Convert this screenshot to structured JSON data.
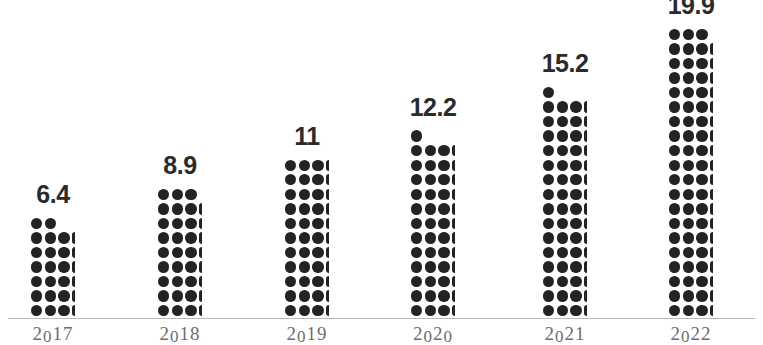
{
  "chart_data": {
    "type": "bar",
    "subtype": "dot-pictogram-column",
    "title": "",
    "subtitle": "",
    "xlabel": "",
    "ylabel": "",
    "categories": [
      "2017",
      "2018",
      "2019",
      "2020",
      "2021",
      "2022"
    ],
    "values": [
      6.4,
      8.9,
      11,
      12.2,
      15.2,
      19.9
    ],
    "value_labels": [
      "6.4",
      "8.9",
      "11",
      "12.2",
      "15.2",
      "19.9"
    ],
    "ylim": [
      0,
      19.9
    ],
    "grid": false,
    "legend": null,
    "annotations": [],
    "axis_line_visible": true,
    "series": [
      {
        "name": "",
        "values": [
          6.4,
          8.9,
          11,
          12.2,
          15.2,
          19.9
        ]
      }
    ]
  },
  "style": {
    "dot_color": "#232323",
    "value_label_color": "#2b2b2b",
    "year_label_color": "#6d6d6d",
    "axis_color": "#b9b9b9",
    "background": "#ffffff"
  },
  "bars": [
    {
      "year": "2017",
      "value_label": "6.4",
      "value": 6.4,
      "full_rows": 6,
      "frac": 0.4,
      "top_row_cols": 2,
      "bar_left": 31,
      "group_left": -9
    },
    {
      "year": "2018",
      "value_label": "8.9",
      "value": 8.9,
      "full_rows": 8,
      "frac": 0.9,
      "top_row_cols": 3,
      "bar_left": 158,
      "group_left": 118
    },
    {
      "year": "2019",
      "value_label": "11",
      "value": 11,
      "full_rows": 11,
      "frac": 0,
      "top_row_cols": 0,
      "bar_left": 285,
      "group_left": 245
    },
    {
      "year": "2020",
      "value_label": "12.2",
      "value": 12.2,
      "full_rows": 12,
      "frac": 0.2,
      "top_row_cols": 1,
      "bar_left": 411,
      "group_left": 371
    },
    {
      "year": "2021",
      "value_label": "15.2",
      "value": 15.2,
      "full_rows": 15,
      "frac": 0.2,
      "top_row_cols": 1,
      "bar_left": 543,
      "group_left": 503
    },
    {
      "year": "2022",
      "value_label": "19.9",
      "value": 19.9,
      "full_rows": 19,
      "frac": 0.9,
      "top_row_cols": 3,
      "bar_left": 669,
      "group_left": 629
    }
  ]
}
